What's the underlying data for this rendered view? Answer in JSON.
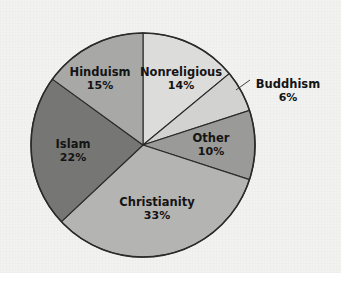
{
  "figure": {
    "background_color": "#f2f2f0",
    "page_color": "#ffffff"
  },
  "chart_data": {
    "type": "pie",
    "title": "",
    "xlabel": "",
    "ylabel": "",
    "legend": "none",
    "grid": false,
    "units": "percent",
    "total": 100,
    "start_angle_deg": 0,
    "direction": "clockwise",
    "categories": [
      "Nonreligious",
      "Buddhism",
      "Other",
      "Christianity",
      "Islam",
      "Hinduism"
    ],
    "values": [
      14,
      6,
      10,
      33,
      22,
      15
    ],
    "labels": [
      "14%",
      "6%",
      "10%",
      "33%",
      "22%",
      "15%"
    ],
    "colors": [
      "#dcdcda",
      "#d2d2d0",
      "#9a9a98",
      "#b4b4b2",
      "#767674",
      "#a8a8a6"
    ],
    "slices": [
      {
        "name": "Nonreligious",
        "value": 14,
        "label": "Nonreligious",
        "percent_label": "14%",
        "color": "#dcdcda",
        "label_placement": "inside",
        "label_x": 181,
        "label_y": 72,
        "pct_x": 181,
        "pct_y": 86
      },
      {
        "name": "Buddhism",
        "value": 6,
        "label": "Buddhism",
        "percent_label": "6%",
        "color": "#d2d2d0",
        "label_placement": "outside",
        "label_x": 288,
        "label_y": 84,
        "pct_x": 288,
        "pct_y": 98,
        "leader_from_x": 236,
        "leader_from_y": 90,
        "leader_to_x": 250,
        "leader_to_y": 80
      },
      {
        "name": "Other",
        "value": 10,
        "label": "Other",
        "percent_label": "10%",
        "color": "#9a9a98",
        "label_placement": "inside",
        "label_x": 211,
        "label_y": 138,
        "pct_x": 211,
        "pct_y": 152
      },
      {
        "name": "Christianity",
        "value": 33,
        "label": "Christianity",
        "percent_label": "33%",
        "color": "#b4b4b2",
        "label_placement": "inside",
        "label_x": 157,
        "label_y": 202,
        "pct_x": 157,
        "pct_y": 216
      },
      {
        "name": "Islam",
        "value": 22,
        "label": "Islam",
        "percent_label": "22%",
        "color": "#767674",
        "label_placement": "inside",
        "label_x": 73,
        "label_y": 144,
        "pct_x": 73,
        "pct_y": 158
      },
      {
        "name": "Hinduism",
        "value": 15,
        "label": "Hinduism",
        "percent_label": "15%",
        "color": "#a8a8a6",
        "label_placement": "inside",
        "label_x": 100,
        "label_y": 72,
        "pct_x": 100,
        "pct_y": 86
      }
    ],
    "geometry": {
      "center_x": 143,
      "center_y": 145,
      "radius": 112,
      "outline_color": "#2a2a2a",
      "divider_color": "#2a2a2a"
    }
  }
}
